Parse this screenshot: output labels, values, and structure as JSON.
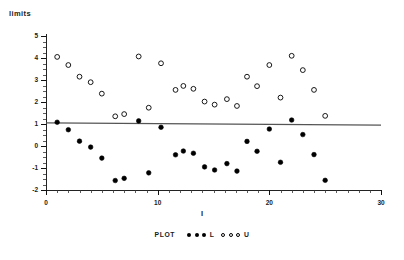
{
  "chart_data": {
    "type": "scatter",
    "title": "",
    "xlabel": "I",
    "ylabel": "limits",
    "xlim": [
      0,
      30
    ],
    "ylim": [
      -2,
      5
    ],
    "xticks": [
      0,
      10,
      20,
      30
    ],
    "xtick_labels": [
      "0",
      "10",
      "20",
      "30"
    ],
    "yticks": [
      -2,
      -1,
      0,
      1,
      2,
      3,
      4,
      5
    ],
    "ytick_labels": [
      "-2",
      "-1",
      "0",
      "1",
      "2",
      "3",
      "4",
      "5"
    ],
    "x_minor_tick_step": 1,
    "y_minor_tick_step": 0.25,
    "grid": false,
    "legend_position": "bottom-center",
    "series": [
      {
        "name": "U",
        "legend_label": "U",
        "marker": "open-circle",
        "color": "#000000",
        "points": [
          {
            "x": 1.0,
            "y": 4.05
          },
          {
            "x": 2.0,
            "y": 3.68
          },
          {
            "x": 3.0,
            "y": 3.15
          },
          {
            "x": 4.0,
            "y": 2.9
          },
          {
            "x": 5.0,
            "y": 2.38
          },
          {
            "x": 6.2,
            "y": 1.35
          },
          {
            "x": 7.0,
            "y": 1.45
          },
          {
            "x": 8.3,
            "y": 4.07
          },
          {
            "x": 9.2,
            "y": 1.74
          },
          {
            "x": 10.3,
            "y": 3.76
          },
          {
            "x": 11.6,
            "y": 2.55
          },
          {
            "x": 12.3,
            "y": 2.73
          },
          {
            "x": 13.2,
            "y": 2.6
          },
          {
            "x": 14.2,
            "y": 2.02
          },
          {
            "x": 15.1,
            "y": 1.88
          },
          {
            "x": 16.2,
            "y": 2.13
          },
          {
            "x": 17.1,
            "y": 1.82
          },
          {
            "x": 18.0,
            "y": 3.15
          },
          {
            "x": 18.9,
            "y": 2.72
          },
          {
            "x": 20.0,
            "y": 3.68
          },
          {
            "x": 21.0,
            "y": 2.2
          },
          {
            "x": 22.0,
            "y": 4.1
          },
          {
            "x": 23.0,
            "y": 3.45
          },
          {
            "x": 24.0,
            "y": 2.55
          },
          {
            "x": 25.0,
            "y": 1.37
          }
        ]
      },
      {
        "name": "L",
        "legend_label": "L",
        "marker": "filled-circle",
        "color": "#000000",
        "points": [
          {
            "x": 1.0,
            "y": 1.08
          },
          {
            "x": 2.0,
            "y": 0.74
          },
          {
            "x": 3.0,
            "y": 0.22
          },
          {
            "x": 4.0,
            "y": -0.05
          },
          {
            "x": 5.0,
            "y": -0.55
          },
          {
            "x": 6.2,
            "y": -1.57
          },
          {
            "x": 7.0,
            "y": -1.47
          },
          {
            "x": 8.3,
            "y": 1.14
          },
          {
            "x": 9.2,
            "y": -1.22
          },
          {
            "x": 10.3,
            "y": 0.85
          },
          {
            "x": 11.6,
            "y": -0.4
          },
          {
            "x": 12.3,
            "y": -0.23
          },
          {
            "x": 13.2,
            "y": -0.33
          },
          {
            "x": 14.2,
            "y": -0.95
          },
          {
            "x": 15.1,
            "y": -1.09
          },
          {
            "x": 16.2,
            "y": -0.8
          },
          {
            "x": 17.1,
            "y": -1.14
          },
          {
            "x": 18.0,
            "y": 0.21
          },
          {
            "x": 18.9,
            "y": -0.24
          },
          {
            "x": 20.0,
            "y": 0.77
          },
          {
            "x": 21.0,
            "y": -0.74
          },
          {
            "x": 22.0,
            "y": 1.18
          },
          {
            "x": 23.0,
            "y": 0.52
          },
          {
            "x": 24.0,
            "y": -0.39
          },
          {
            "x": 25.0,
            "y": -1.56
          }
        ]
      }
    ],
    "reference_line": {
      "name": "center-line",
      "color": "#555555",
      "x_start": 0,
      "y_start": 1.05,
      "x_end": 30,
      "y_end": 0.95
    }
  },
  "legend": {
    "prefix": "PLOT",
    "entries": [
      {
        "label": "L",
        "marker": "filled-circle",
        "marker_count": 3
      },
      {
        "label": "U",
        "marker": "open-circle",
        "marker_count": 3
      }
    ]
  },
  "icons": {
    "filled_circle": "filled-circle-marker-icon",
    "open_circle": "open-circle-marker-icon"
  }
}
